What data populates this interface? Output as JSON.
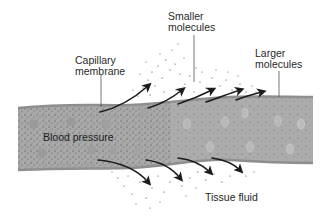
{
  "diagram": {
    "type": "capillary-exchange",
    "colors": {
      "background": "#ffffff",
      "vessel_fill": "#a9a9a9",
      "vessel_edge": "#8e8e8e",
      "cell": "#9a9a9a",
      "arrow": "#1c1c1c",
      "text": "#2a2a2a"
    },
    "labels": {
      "capillary_membrane": {
        "line1": "Capillary",
        "line2": "membrane"
      },
      "smaller_molecules": {
        "line1": "Smaller",
        "line2": "molecules"
      },
      "larger_molecules": {
        "line1": "Larger",
        "line2": "molecules"
      },
      "blood_pressure": "Blood pressure",
      "tissue_fluid": "Tissue fluid"
    }
  }
}
